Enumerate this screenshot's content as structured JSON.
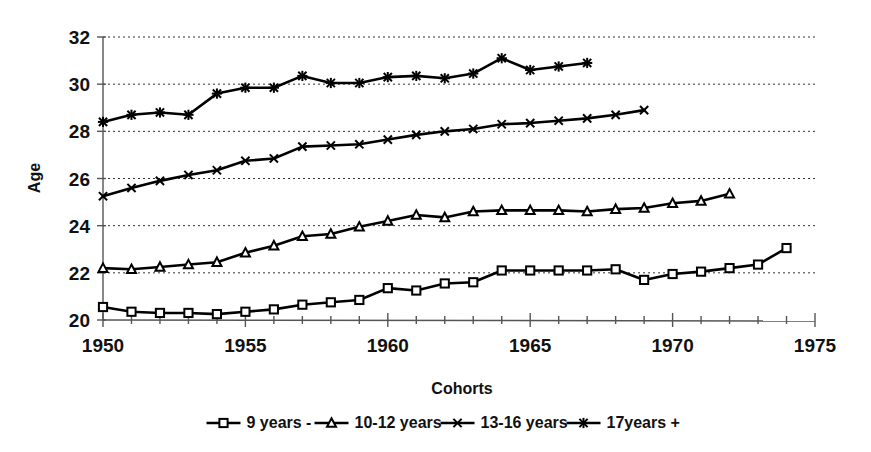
{
  "chart_data": {
    "type": "line",
    "title": "",
    "xlabel": "Cohorts",
    "ylabel": "Age",
    "xlim": [
      1950,
      1975
    ],
    "ylim": [
      20,
      32
    ],
    "ytick_step": 2,
    "xtick_step": 5,
    "grid": true,
    "grid_style": "dotted-horizontal",
    "legend_position": "bottom",
    "xticks": [
      1950,
      1955,
      1960,
      1965,
      1970,
      1975
    ],
    "yticks": [
      20,
      22,
      24,
      26,
      28,
      30,
      32
    ],
    "xtick_labels": [
      "1950",
      "1955",
      "1960",
      "1965",
      "1970",
      "1975"
    ],
    "ytick_labels": [
      "20",
      "22",
      "24",
      "26",
      "28",
      "30",
      "32"
    ],
    "series": [
      {
        "name": "9 years -",
        "marker": "square-hollow",
        "x": [
          1950,
          1951,
          1952,
          1953,
          1954,
          1955,
          1956,
          1957,
          1958,
          1959,
          1960,
          1961,
          1962,
          1963,
          1964,
          1965,
          1966,
          1967,
          1968,
          1969,
          1970,
          1971,
          1972,
          1973,
          1974
        ],
        "values": [
          20.55,
          20.35,
          20.3,
          20.3,
          20.25,
          20.35,
          20.45,
          20.65,
          20.75,
          20.85,
          21.35,
          21.25,
          21.55,
          21.6,
          22.1,
          22.1,
          22.1,
          22.1,
          22.15,
          21.7,
          21.95,
          22.05,
          22.2,
          22.35,
          23.05
        ]
      },
      {
        "name": "10-12 years",
        "marker": "triangle-hollow",
        "x": [
          1950,
          1951,
          1952,
          1953,
          1954,
          1955,
          1956,
          1957,
          1958,
          1959,
          1960,
          1961,
          1962,
          1963,
          1964,
          1965,
          1966,
          1967,
          1968,
          1969,
          1970,
          1971,
          1972
        ],
        "values": [
          22.2,
          22.15,
          22.25,
          22.35,
          22.45,
          22.85,
          23.15,
          23.55,
          23.65,
          23.95,
          24.2,
          24.45,
          24.35,
          24.6,
          24.65,
          24.65,
          24.65,
          24.6,
          24.7,
          24.75,
          24.95,
          25.05,
          25.35
        ]
      },
      {
        "name": "13-16 years",
        "marker": "x-cross",
        "x": [
          1950,
          1951,
          1952,
          1953,
          1954,
          1955,
          1956,
          1957,
          1958,
          1959,
          1960,
          1961,
          1962,
          1963,
          1964,
          1965,
          1966,
          1967,
          1968,
          1969
        ],
        "values": [
          25.25,
          25.6,
          25.9,
          26.15,
          26.35,
          26.75,
          26.85,
          27.35,
          27.4,
          27.45,
          27.65,
          27.85,
          28.0,
          28.1,
          28.3,
          28.35,
          28.45,
          28.55,
          28.7,
          28.9
        ]
      },
      {
        "name": "17years +",
        "marker": "star-asterisk",
        "x": [
          1950,
          1951,
          1952,
          1953,
          1954,
          1955,
          1956,
          1957,
          1958,
          1959,
          1960,
          1961,
          1962,
          1963,
          1964,
          1965,
          1966,
          1967
        ],
        "values": [
          28.4,
          28.7,
          28.8,
          28.7,
          29.6,
          29.85,
          29.85,
          30.35,
          30.05,
          30.05,
          30.3,
          30.35,
          30.25,
          30.45,
          31.1,
          30.6,
          30.75,
          30.9
        ]
      }
    ]
  },
  "legend": {
    "items": [
      {
        "label": "9 years -",
        "marker": "square-hollow"
      },
      {
        "label": "10-12 years",
        "marker": "triangle-hollow"
      },
      {
        "label": "13-16 years",
        "marker": "x-cross"
      },
      {
        "label": "17years +",
        "marker": "star-asterisk"
      }
    ]
  },
  "colors": {
    "series": "#000000",
    "grid": "#333333",
    "axis": "#555555",
    "background": "#ffffff"
  }
}
